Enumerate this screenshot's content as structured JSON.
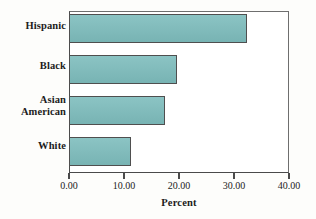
{
  "chart_data": {
    "type": "bar",
    "orientation": "horizontal",
    "title": "",
    "xlabel": "Percent",
    "ylabel": "",
    "categories": [
      "Hispanic",
      "Black",
      "Asian American",
      "White"
    ],
    "values": [
      32.4,
      19.6,
      17.4,
      11.3
    ],
    "xlim": [
      0,
      40
    ],
    "xticks": [
      0,
      10,
      20,
      30,
      40
    ],
    "xtick_labels": [
      "0.00",
      "10.00",
      "20.00",
      "30.00",
      "40.00"
    ],
    "grid": false,
    "legend": null,
    "bar_color": "#7ebdbd",
    "bar_border_color": "#4f4f4f",
    "axis_color": "#4a4a4a",
    "background": "#fdfdfb"
  },
  "labels": {
    "hispanic": "Hispanic",
    "black": "Black",
    "asian_line1": "Asian",
    "asian_line2": "American",
    "white": "White",
    "axis_title": "Percent"
  }
}
